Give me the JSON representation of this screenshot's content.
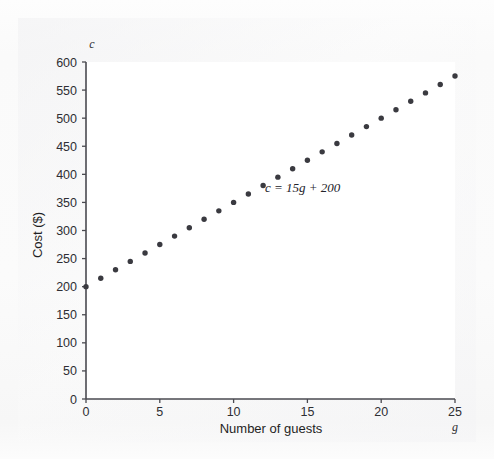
{
  "figure": {
    "background_color": "#fbfbfb",
    "plot_background_color": "#ffffff",
    "axis_color": "#4a4a50",
    "marker_color": "#3a3a40"
  },
  "labels": {
    "y_axis_variable": "c",
    "x_axis_variable": "g",
    "y_axis_title": "Cost ($)",
    "x_axis_title": "Number of guests",
    "equation": "c = 15g + 200"
  },
  "chart_data": {
    "type": "scatter",
    "title": "",
    "xlabel": "Number of guests",
    "ylabel": "Cost ($)",
    "annotations": [
      "c = 15g + 200"
    ],
    "grid": false,
    "legend": false,
    "xlim": [
      0,
      25
    ],
    "ylim": [
      0,
      600
    ],
    "xticks": [
      0,
      5,
      10,
      15,
      20,
      25
    ],
    "xtick_labels": [
      "0",
      "5",
      "10",
      "15",
      "20",
      "25"
    ],
    "yticks": [
      0,
      50,
      100,
      150,
      200,
      250,
      300,
      350,
      400,
      450,
      500,
      550,
      600
    ],
    "ytick_labels": [
      "0",
      "50",
      "100",
      "150",
      "200",
      "250",
      "300",
      "350",
      "400",
      "450",
      "500",
      "550",
      "600"
    ],
    "x": [
      0,
      1,
      2,
      3,
      4,
      5,
      6,
      7,
      8,
      9,
      10,
      11,
      12,
      13,
      14,
      15,
      16,
      17,
      18,
      19,
      20,
      21,
      22,
      23,
      24,
      25
    ],
    "values": [
      200,
      215,
      230,
      245,
      260,
      275,
      290,
      305,
      320,
      335,
      350,
      365,
      380,
      395,
      410,
      425,
      440,
      455,
      470,
      485,
      500,
      515,
      530,
      545,
      560,
      575
    ],
    "series": [
      {
        "name": "c = 15g + 200",
        "x": [
          0,
          1,
          2,
          3,
          4,
          5,
          6,
          7,
          8,
          9,
          10,
          11,
          12,
          13,
          14,
          15,
          16,
          17,
          18,
          19,
          20,
          21,
          22,
          23,
          24,
          25
        ],
        "values": [
          200,
          215,
          230,
          245,
          260,
          275,
          290,
          305,
          320,
          335,
          350,
          365,
          380,
          395,
          410,
          425,
          440,
          455,
          470,
          485,
          500,
          515,
          530,
          545,
          560,
          575
        ]
      }
    ]
  }
}
